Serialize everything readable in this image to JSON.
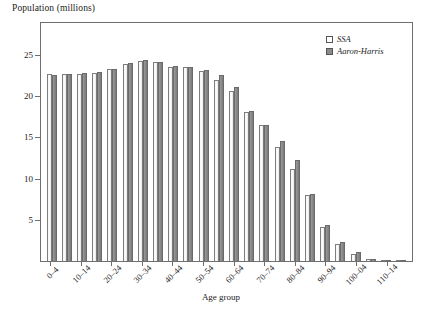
{
  "chart_data": {
    "type": "bar",
    "title": "",
    "ylabel": "Population (millions)",
    "xlabel": "Age group",
    "ylim": [
      0,
      29
    ],
    "yticks": [
      5,
      10,
      15,
      20,
      25
    ],
    "grid": false,
    "legend_position": "top-right",
    "categories": [
      "0–4",
      "5–9",
      "10–14",
      "15–19",
      "20–24",
      "25–29",
      "30–34",
      "35–39",
      "40–44",
      "45–49",
      "50–54",
      "55–59",
      "60–64",
      "65–69",
      "70–74",
      "75–79",
      "80–84",
      "85–89",
      "90–94",
      "95–99",
      "100–04",
      "105–09",
      "110–14",
      "115–19"
    ],
    "tick_labels": [
      "0–4",
      "10–14",
      "20–24",
      "30–34",
      "40–44",
      "50–54",
      "60–64",
      "70–74",
      "80–84",
      "90–94",
      "100–04",
      "110–14"
    ],
    "tick_label_indices": [
      0,
      2,
      4,
      6,
      8,
      10,
      12,
      14,
      16,
      18,
      20,
      22
    ],
    "series": [
      {
        "name": "SSA",
        "color": "#ffffff",
        "values": [
          22.6,
          22.6,
          22.6,
          22.7,
          23.2,
          23.8,
          24.2,
          24.1,
          23.5,
          23.4,
          23.0,
          21.9,
          20.6,
          18.0,
          16.4,
          13.8,
          11.1,
          8.0,
          4.1,
          2.0,
          0.8,
          0.2,
          0.1,
          0.0
        ]
      },
      {
        "name": "Aaron-Harris",
        "color": "#8b8b8b",
        "values": [
          22.5,
          22.6,
          22.7,
          22.8,
          23.2,
          23.9,
          24.3,
          24.1,
          23.6,
          23.5,
          23.1,
          22.5,
          21.0,
          18.1,
          16.4,
          14.5,
          12.2,
          8.1,
          4.3,
          2.3,
          1.1,
          0.3,
          0.1,
          0.0
        ]
      }
    ]
  },
  "legend": {
    "items": [
      {
        "label": "SSA",
        "swatch": "light-square-swatch"
      },
      {
        "label": "Aaron-Harris",
        "swatch": "dark-square-swatch"
      }
    ]
  }
}
